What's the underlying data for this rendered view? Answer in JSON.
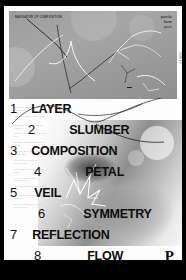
{
  "poster": {
    "panel": {
      "caption": "NAVIGATOR OF COMPOSITION",
      "wordmark_line1": "poetic",
      "wordmark_line2": "form",
      "wordmark_line3": "quiet",
      "vertical_label": "SERIES"
    },
    "list": [
      {
        "number": "1",
        "word": "LAYER"
      },
      {
        "number": "2",
        "word": "SLUMBER"
      },
      {
        "number": "3",
        "word": "COMPOSITION"
      },
      {
        "number": "4",
        "word": "PETAL"
      },
      {
        "number": "5",
        "word": "VEIL"
      },
      {
        "number": "6",
        "word": "SYMMETRY"
      },
      {
        "number": "7",
        "word": "REFLECTION"
      },
      {
        "number": "8",
        "word": "FLOW"
      }
    ],
    "logo": "P",
    "microtext": [
      "lorem ipsum dolor sit amet consectetur",
      "adipiscing elit sed do eiusmod tempor",
      "incididunt ut labore et dolore magna",
      "aliqua ut enim ad minim veniam quis",
      "nostrud exercitation ullamco laboris",
      "nisi ut aliquip ex ea commodo consequat",
      "duis aute irure dolor in reprehenderit",
      "in voluptate velit esse cillum dolore",
      "eu fugiat nulla pariatur excepteur sint",
      "occaecat cupidatat non proident sunt",
      "in culpa qui officia deserunt mollit",
      "anim id est laborum sed ut perspiciatis"
    ]
  },
  "colors": {
    "page_background": "#000000",
    "poster_background": "#fdfdfd",
    "panel_gray": "#9d9d9d",
    "text": "#0d0d0d"
  }
}
